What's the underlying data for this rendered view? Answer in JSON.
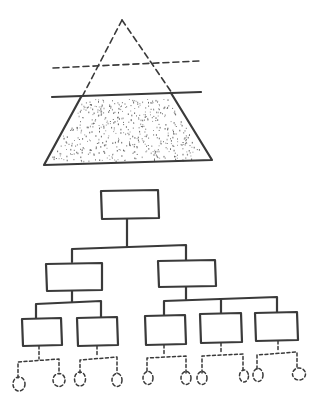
{
  "diagram": {
    "style": "hand-drawn sketch",
    "ink_color": "#3a3a3a",
    "background": "#ffffff",
    "pyramid": {
      "apex": [
        122,
        20
      ],
      "base_left": [
        44,
        165
      ],
      "base_right": [
        212,
        160
      ],
      "upper_section": "dashed outline (unfilled)",
      "lower_section": "solid outline, stippled fill",
      "dashed_divider": {
        "x1": 53,
        "y1": 68,
        "x2": 199,
        "y2": 61
      },
      "solid_divider": {
        "x1": 52,
        "y1": 97,
        "x2": 201,
        "y2": 92
      }
    },
    "org_chart": {
      "levels": 4,
      "root": {
        "box": [
          101,
          190,
          58,
          28
        ]
      },
      "level2": [
        {
          "box": [
            46,
            263,
            56,
            28
          ],
          "children": 2
        },
        {
          "box": [
            158,
            260,
            58,
            27
          ],
          "children": 3
        }
      ],
      "level3": [
        {
          "box": [
            22,
            318,
            40,
            28
          ]
        },
        {
          "box": [
            77,
            317,
            41,
            29
          ]
        },
        {
          "box": [
            145,
            315,
            41,
            30
          ]
        },
        {
          "box": [
            200,
            313,
            42,
            30
          ]
        },
        {
          "box": [
            255,
            312,
            43,
            29
          ]
        }
      ],
      "level4_leaf_count": 10,
      "level4_style": "dashed ovals connected with dashed lines"
    }
  }
}
